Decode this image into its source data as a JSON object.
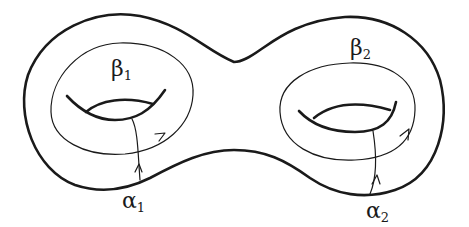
{
  "figure": {
    "labels": {
      "beta1": {
        "symbol": "β",
        "sub": "1"
      },
      "beta2": {
        "symbol": "β",
        "sub": "2"
      },
      "alpha1": {
        "symbol": "α",
        "sub": "1"
      },
      "alpha2": {
        "symbol": "α",
        "sub": "2"
      }
    },
    "colors": {
      "stroke": "#1a1a1a",
      "background": "#ffffff"
    }
  }
}
